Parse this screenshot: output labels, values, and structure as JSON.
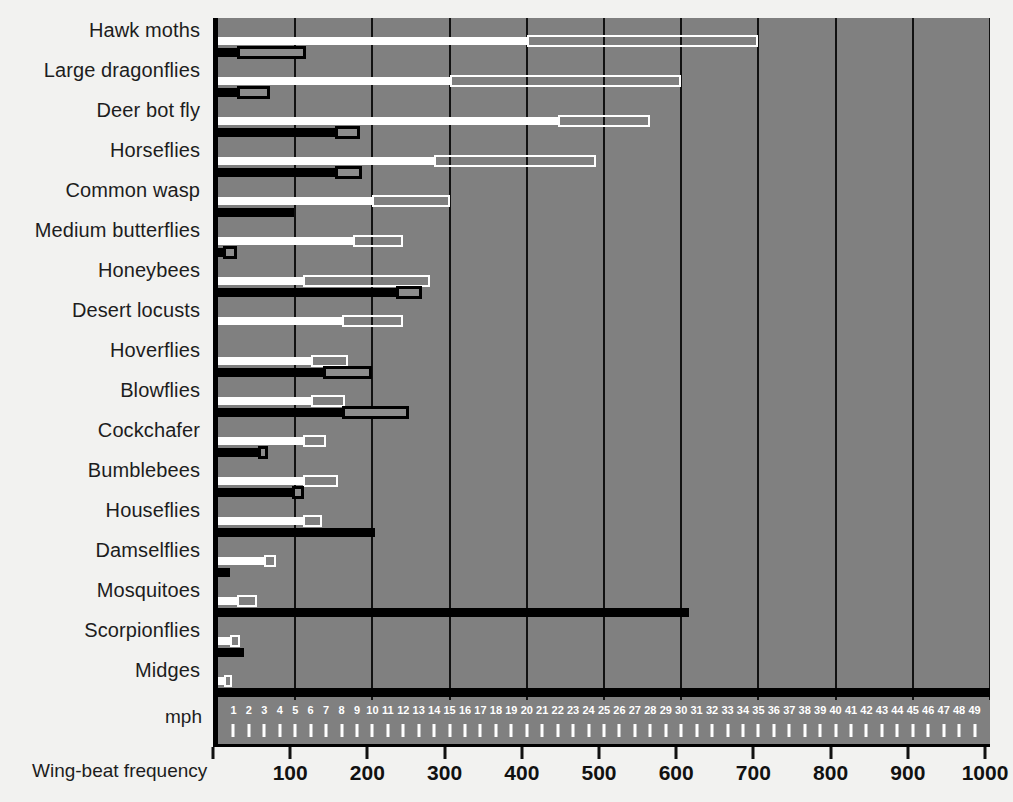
{
  "chart_data": {
    "type": "bar",
    "title": "",
    "xlabel": "Wing-beat frequency",
    "secondary_xlabel": "mph",
    "ylabel": "",
    "xlim": [
      0,
      1000
    ],
    "xticks": [
      0,
      100,
      200,
      300,
      400,
      500,
      600,
      700,
      800,
      900,
      1000
    ],
    "xticklabels": [
      "",
      "100",
      "200",
      "300",
      "400",
      "500",
      "600",
      "700",
      "800",
      "900",
      "1000"
    ],
    "secondary_xlim": [
      0,
      50
    ],
    "secondary_xticks": [
      1,
      2,
      3,
      4,
      5,
      6,
      7,
      8,
      9,
      10,
      11,
      12,
      13,
      14,
      15,
      16,
      17,
      18,
      19,
      20,
      21,
      22,
      23,
      24,
      25,
      26,
      27,
      28,
      29,
      30,
      31,
      32,
      33,
      34,
      35,
      36,
      37,
      38,
      39,
      40,
      41,
      42,
      43,
      44,
      45,
      46,
      47,
      48,
      49
    ],
    "grid": true,
    "gridlines_at": [
      100,
      200,
      300,
      400,
      500,
      600,
      700,
      800,
      900,
      1000
    ],
    "legend": [],
    "series": [
      {
        "name": "wing-beat frequency (Hz)",
        "style": "white-bar"
      },
      {
        "name": "speed (mph)",
        "style": "black-bar"
      }
    ],
    "categories": [
      "Hawk moths",
      "Large dragonflies",
      "Deer bot fly",
      "Horseflies",
      "Common wasp",
      "Medium butterflies",
      "Honeybees",
      "Desert locusts",
      "Hoverflies",
      "Blowflies",
      "Cockchafer",
      "Bumblebees",
      "Houseflies",
      "Damselflies",
      "Mosquitoes",
      "Scorpionflies",
      "Midges"
    ],
    "rows": [
      {
        "category": "Hawk moths",
        "hz_solid": [
          0,
          400
        ],
        "hz_hollow": [
          400,
          700
        ],
        "mph_solid": [
          0,
          1.2
        ],
        "mph_box": [
          1.2,
          5.7
        ]
      },
      {
        "category": "Large dragonflies",
        "hz_solid": [
          0,
          300
        ],
        "hz_hollow": [
          300,
          600
        ],
        "mph_solid": [
          0,
          1.2
        ],
        "mph_box": [
          1.2,
          3.4
        ]
      },
      {
        "category": "Deer bot fly",
        "hz_solid": [
          0,
          440
        ],
        "hz_hollow": [
          440,
          560
        ],
        "mph_solid": [
          0,
          7.6
        ],
        "mph_box": [
          7.6,
          9.2
        ]
      },
      {
        "category": "Horseflies",
        "hz_solid": [
          0,
          280
        ],
        "hz_hollow": [
          280,
          490
        ],
        "mph_solid": [
          0,
          7.6
        ],
        "mph_box": [
          7.6,
          9.3
        ]
      },
      {
        "category": "Common wasp",
        "hz_solid": [
          0,
          200
        ],
        "hz_hollow": [
          200,
          300
        ],
        "mph_solid": [
          0,
          4.9
        ],
        "mph_box": null
      },
      {
        "category": "Medium butterflies",
        "hz_solid": [
          0,
          175
        ],
        "hz_hollow": [
          175,
          240
        ],
        "mph_solid": [
          0,
          0.5
        ],
        "mph_box": [
          0.3,
          1.2
        ]
      },
      {
        "category": "Honeybees",
        "hz_solid": [
          0,
          110
        ],
        "hz_hollow": [
          110,
          275
        ],
        "mph_solid": [
          0,
          11.5
        ],
        "mph_box": [
          11.5,
          13.2
        ]
      },
      {
        "category": "Desert locusts",
        "hz_solid": [
          0,
          160
        ],
        "hz_hollow": [
          160,
          240
        ],
        "mph_solid": null,
        "mph_box": null
      },
      {
        "category": "Hoverflies",
        "hz_solid": [
          0,
          120
        ],
        "hz_hollow": [
          120,
          168
        ],
        "mph_solid": [
          0,
          9.2
        ],
        "mph_box": [
          6.8,
          10.0
        ]
      },
      {
        "category": "Blowflies",
        "hz_solid": [
          0,
          120
        ],
        "hz_hollow": [
          120,
          165
        ],
        "mph_solid": [
          0,
          8.0
        ],
        "mph_box": [
          8.0,
          12.4
        ]
      },
      {
        "category": "Cockchafer",
        "hz_solid": [
          0,
          110
        ],
        "hz_hollow": [
          110,
          140
        ],
        "mph_solid": [
          0,
          2.6
        ],
        "mph_box": [
          2.6,
          3.2
        ]
      },
      {
        "category": "Bumblebees",
        "hz_solid": [
          0,
          110
        ],
        "hz_hollow": [
          110,
          155
        ],
        "mph_solid": [
          0,
          4.8
        ],
        "mph_box": [
          4.8,
          5.6
        ]
      },
      {
        "category": "Houseflies",
        "hz_solid": [
          0,
          110
        ],
        "hz_hollow": [
          110,
          135
        ],
        "mph_solid": [
          0,
          10.2
        ],
        "mph_box": null
      },
      {
        "category": "Damselflies",
        "hz_solid": [
          0,
          60
        ],
        "hz_hollow": [
          60,
          75
        ],
        "mph_solid": [
          0,
          0.8
        ],
        "mph_box": null
      },
      {
        "category": "Mosquitoes",
        "hz_solid": [
          0,
          25
        ],
        "hz_hollow": [
          25,
          50
        ],
        "mph_solid": [
          0,
          30.5
        ],
        "mph_box": null
      },
      {
        "category": "Scorpionflies",
        "hz_solid": [
          0,
          15
        ],
        "hz_hollow": [
          15,
          28
        ],
        "mph_solid": [
          0,
          1.7
        ],
        "mph_box": null
      },
      {
        "category": "Midges",
        "hz_solid": [
          0,
          8
        ],
        "hz_hollow": [
          8,
          18
        ],
        "mph_solid": [
          0,
          51
        ],
        "mph_box": null
      }
    ]
  }
}
